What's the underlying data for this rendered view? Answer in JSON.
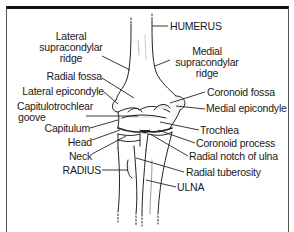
{
  "figure": {
    "border_color": "#111111",
    "line_color": "#222222"
  },
  "labels": {
    "left": [
      {
        "id": "lateral-supracondylar-ridge",
        "lines": [
          "Lateral",
          "supracondylar",
          "ridge"
        ]
      },
      {
        "id": "radial-fossa",
        "text": "Radial fossa"
      },
      {
        "id": "lateral-epicondyle",
        "text": "Lateral epicondyle"
      },
      {
        "id": "capitulotrochlear-groove",
        "lines": [
          "Capitulotrochlear",
          "goove"
        ]
      },
      {
        "id": "capitulum",
        "text": "Capitulum"
      },
      {
        "id": "head",
        "text": "Head"
      },
      {
        "id": "neck",
        "text": "Neck"
      },
      {
        "id": "radius",
        "text": "RADIUS"
      }
    ],
    "right": [
      {
        "id": "humerus",
        "text": "HUMERUS"
      },
      {
        "id": "medial-supracondylar-ridge",
        "lines": [
          "Medial",
          "supracondylar",
          "ridge"
        ]
      },
      {
        "id": "coronoid-fossa",
        "text": "Coronoid fossa"
      },
      {
        "id": "medial-epicondyle",
        "text": "Medial epicondyle"
      },
      {
        "id": "trochlea",
        "text": "Trochlea"
      },
      {
        "id": "coronoid-process",
        "text": "Coronoid process"
      },
      {
        "id": "radial-notch-of-ulna",
        "text": "Radial notch of ulna"
      },
      {
        "id": "radial-tuberosity",
        "text": "Radial tuberosity"
      },
      {
        "id": "ulna",
        "text": "ULNA"
      }
    ]
  }
}
